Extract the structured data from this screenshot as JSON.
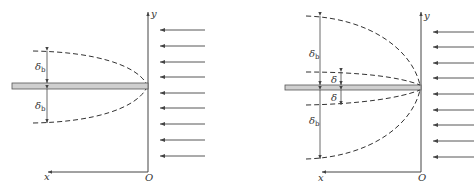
{
  "figure": {
    "colors": {
      "line": "#444444",
      "plate_fill": "#cfcfcf",
      "dashed": "#333333",
      "background": "#ffffff"
    }
  },
  "panels": [
    {
      "id": "left",
      "axes": {
        "x_label": "x",
        "y_label": "y",
        "origin_label": "O"
      },
      "labels": {
        "upper": "δ",
        "upper_sub": "b",
        "lower": "δ",
        "lower_sub": "b"
      },
      "flow_arrows_count": 9
    },
    {
      "id": "right",
      "axes": {
        "x_label": "x",
        "y_label": "y",
        "origin_label": "O"
      },
      "labels": {
        "outer_upper": "δ",
        "outer_upper_sub": "b",
        "outer_lower": "δ",
        "outer_lower_sub": "b",
        "inner_upper": "δ",
        "inner_lower": "δ"
      },
      "flow_arrows_count": 9
    }
  ]
}
